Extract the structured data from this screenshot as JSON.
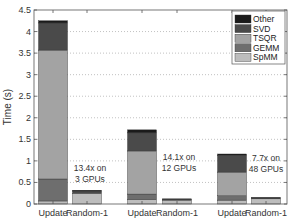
{
  "chart_data": {
    "type": "bar",
    "stacked": true,
    "title": "",
    "xlabel": "",
    "ylabel": "Time (s)",
    "ylim": [
      0,
      4.5
    ],
    "yticks": [
      0,
      0.5,
      1,
      1.5,
      2,
      2.5,
      3,
      3.5,
      4,
      4.5
    ],
    "ytick_labels": [
      "0",
      "0.5",
      "1",
      "1.5",
      "2",
      "2.5",
      "3",
      "3.5",
      "4",
      "4.5"
    ],
    "grid": "dotted horizontal",
    "legend_position": "upper right",
    "categories": [
      "Update",
      "Random-1",
      "Update",
      "Random-1",
      "Update",
      "Random-1"
    ],
    "groups": [
      "3 GPUs",
      "12 GPUs",
      "48 GPUs"
    ],
    "series": [
      {
        "name": "SpMM",
        "color": "#bdbdbd",
        "values": [
          0.07,
          0.25,
          0.1,
          0.09,
          0.09,
          0.12
        ]
      },
      {
        "name": "GEMM",
        "color": "#6e6e6e",
        "values": [
          0.51,
          0.0,
          0.13,
          0.0,
          0.1,
          0.0
        ]
      },
      {
        "name": "TSQR",
        "color": "#a3a3a3",
        "values": [
          2.99,
          0.0,
          1.0,
          0.0,
          0.55,
          0.0
        ]
      },
      {
        "name": "SVD",
        "color": "#4a4a4a",
        "values": [
          0.63,
          0.05,
          0.42,
          0.02,
          0.39,
          0.02
        ]
      },
      {
        "name": "Other",
        "color": "#1a1a1a",
        "values": [
          0.05,
          0.02,
          0.07,
          0.01,
          0.03,
          0.01
        ]
      }
    ],
    "totals": [
      4.25,
      0.32,
      1.72,
      0.12,
      1.16,
      0.15
    ],
    "annotations": [
      {
        "text_line1": "13.4x on",
        "text_line2": "3 GPUs"
      },
      {
        "text_line1": "14.1x on",
        "text_line2": "12 GPUs"
      },
      {
        "text_line1": "7.7x on",
        "text_line2": "48 GPUs"
      }
    ]
  },
  "legend": {
    "items": [
      {
        "label": "Other",
        "color": "#1a1a1a"
      },
      {
        "label": "SVD",
        "color": "#4a4a4a"
      },
      {
        "label": "TSQR",
        "color": "#a3a3a3"
      },
      {
        "label": "GEMM",
        "color": "#6e6e6e"
      },
      {
        "label": "SpMM",
        "color": "#bdbdbd"
      }
    ]
  }
}
